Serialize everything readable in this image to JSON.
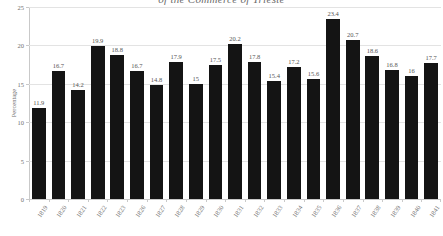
{
  "chart_data": {
    "type": "bar",
    "title": "of the Commerce of Trieste",
    "xlabel": "",
    "ylabel": "Percentage",
    "ylim": [
      0,
      25
    ],
    "yticks": [
      0,
      5,
      10,
      15,
      20,
      25
    ],
    "grid": true,
    "legend": null,
    "bar_color": "#141414",
    "categories": [
      "1819",
      "1820",
      "1821",
      "1822",
      "1823",
      "1826",
      "1827",
      "1828",
      "1829",
      "1830",
      "1831",
      "1832",
      "1833",
      "1834",
      "1835",
      "1836",
      "1837",
      "1838",
      "1839",
      "1840",
      "1841"
    ],
    "values": [
      11.9,
      16.7,
      14.2,
      19.9,
      18.8,
      16.7,
      14.8,
      17.9,
      15,
      17.5,
      20.2,
      17.8,
      15.4,
      17.2,
      15.6,
      23.4,
      20.7,
      18.6,
      16.8,
      16,
      17.7
    ],
    "value_labels": [
      "11.9",
      "16.7",
      "14.2",
      "19.9",
      "18.8",
      "16.7",
      "14.8",
      "17.9",
      "15",
      "17.5",
      "20.2",
      "17.8",
      "15.4",
      "17.2",
      "15.6",
      "23.4",
      "20.7",
      "18.6",
      "16.8",
      "16",
      "17.7"
    ]
  }
}
